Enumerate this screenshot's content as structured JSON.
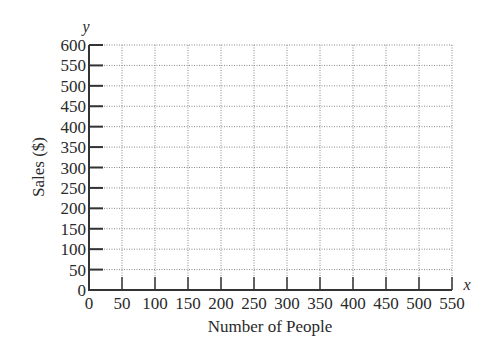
{
  "chart_data": {
    "type": "line",
    "title": "",
    "xlabel": "Number of People",
    "ylabel": "Sales ($)",
    "x_axis_variable": "x",
    "y_axis_variable": "y",
    "xlim": [
      0,
      550
    ],
    "ylim": [
      0,
      600
    ],
    "x_ticks": [
      0,
      50,
      100,
      150,
      200,
      250,
      300,
      350,
      400,
      450,
      500,
      550
    ],
    "y_ticks": [
      0,
      50,
      100,
      150,
      200,
      250,
      300,
      350,
      400,
      450,
      500,
      550,
      600
    ],
    "grid": true,
    "grid_style": "dotted",
    "series": []
  },
  "labels": {
    "xlabel": "Number of People",
    "ylabel": "Sales ($)",
    "xvar": "x",
    "yvar": "y"
  }
}
